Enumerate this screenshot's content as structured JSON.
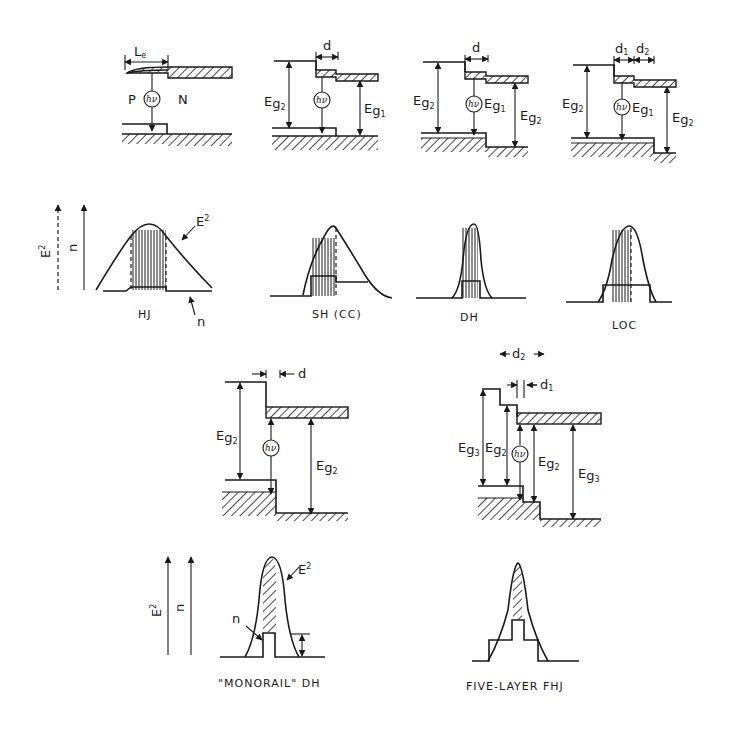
{
  "figure": {
    "top_row": [
      {
        "id": "hj",
        "label": "HJ",
        "dims": [
          "Le"
        ],
        "regions": [
          "P",
          "N"
        ],
        "gaps": [],
        "photon": "hν"
      },
      {
        "id": "sh",
        "label": "SH  (CC)",
        "dims": [
          "d"
        ],
        "gaps": [
          "Eg2",
          "Eg1"
        ],
        "photon": "hν"
      },
      {
        "id": "dh",
        "label": "DH",
        "dims": [
          "d"
        ],
        "gaps": [
          "Eg2",
          "Eg1",
          "Eg2"
        ],
        "photon": "hν"
      },
      {
        "id": "loc",
        "label": "LOC",
        "dims": [
          "d1",
          "d2"
        ],
        "gaps": [
          "Eg2",
          "Eg1",
          "Eg2"
        ],
        "photon": "hν"
      }
    ],
    "bottom_row": [
      {
        "id": "monorail",
        "label": "\"MONORAIL\"  DH",
        "dims": [
          "d"
        ],
        "gaps": [
          "Eg2",
          "Eg2"
        ],
        "photon": "hν"
      },
      {
        "id": "fhj",
        "label": "FIVE-LAYER FHJ",
        "dims": [
          "d2",
          "d1"
        ],
        "gaps": [
          "Eg3",
          "Eg2",
          "Eg2",
          "Eg3"
        ],
        "photon": "hν"
      }
    ],
    "axes": {
      "field": "E",
      "field_sup": "2",
      "index": "n"
    },
    "curve_labels": {
      "field": "E",
      "field_sup": "2",
      "index": "n"
    },
    "symbols": {
      "Le": "L",
      "Le_sub": "e",
      "E": "E",
      "g": "g",
      "d": "d"
    },
    "colors": {
      "ink": "#1a1a1a",
      "background": "#ffffff"
    }
  }
}
